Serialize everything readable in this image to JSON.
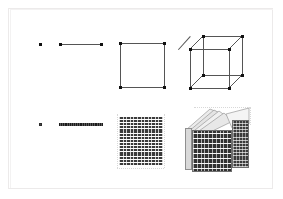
{
  "figure": {
    "frame_color": "#eceaea",
    "background": "#ffffff",
    "ink_color": "#111111",
    "edge_color": "#555555",
    "accent_gray": "#d9d9d9",
    "dark_fill": "#2f2f2f"
  },
  "rows": [
    {
      "name": "continuous-row",
      "label": "",
      "panels": [
        {
          "name": "point",
          "dimension": 0,
          "vertices": 1,
          "edges": 0,
          "label": ""
        },
        {
          "name": "segment",
          "dimension": 1,
          "vertices": 2,
          "edges": 1,
          "label": ""
        },
        {
          "name": "square",
          "dimension": 2,
          "vertices": 4,
          "edges": 4,
          "label": ""
        },
        {
          "name": "cube",
          "dimension": 3,
          "vertices": 8,
          "edges": 12,
          "label": ""
        }
      ]
    },
    {
      "name": "discretised-row",
      "label": "",
      "panels": [
        {
          "name": "point-sampled",
          "dimension": 0,
          "samples": 1,
          "label": ""
        },
        {
          "name": "segment-sampled",
          "dimension": 1,
          "samples": 24,
          "label": ""
        },
        {
          "name": "square-sampled",
          "dimension": 2,
          "samples": 576,
          "label": ""
        },
        {
          "name": "cube-sampled",
          "dimension": 3,
          "samples": 13824,
          "label": ""
        }
      ]
    }
  ],
  "chart_data": {
    "type": "diagram",
    "title": "",
    "subtitle": "",
    "xlabel": "",
    "ylabel": "",
    "grid": false,
    "legend_position": "none",
    "annotations": [],
    "series": [
      {
        "name": "continuous-row",
        "values": [
          0,
          1,
          2,
          3
        ]
      },
      {
        "name": "discretised-row",
        "values": [
          0,
          1,
          2,
          3
        ]
      }
    ],
    "categories": [
      "point",
      "segment",
      "square",
      "cube"
    ]
  },
  "geometry": {
    "point": {
      "cx": 40,
      "cy": 44
    },
    "segment": {
      "x1": 60,
      "x2": 101,
      "y": 44
    },
    "square": {
      "left": 120,
      "top": 43,
      "size": 44
    },
    "cube": {
      "front_left": 190,
      "front_top": 49,
      "front_size": 39,
      "depth_x": 13,
      "depth_y": -13
    },
    "point_sampled": {
      "cx": 40,
      "cy": 124
    },
    "segment_sampled": {
      "x1": 59,
      "x2": 101,
      "y": 124
    },
    "square_sampled": {
      "left": 119,
      "top": 117,
      "width": 44,
      "height": 48,
      "rows": 17,
      "cols": 13
    },
    "cube_sampled": {
      "left": 185,
      "top": 108,
      "width": 66,
      "height": 64,
      "rows": 17
    }
  }
}
